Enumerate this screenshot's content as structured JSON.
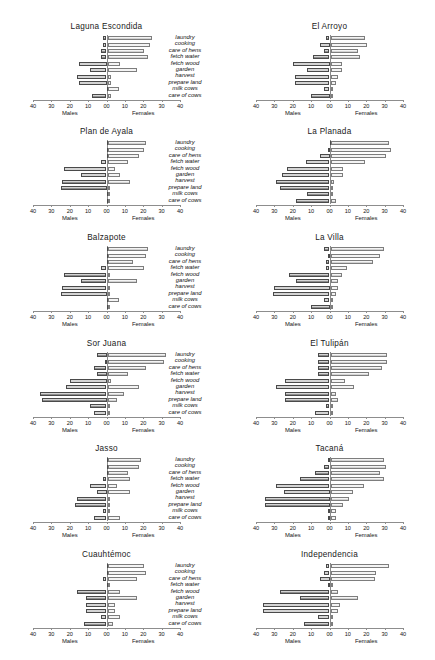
{
  "figure": {
    "width": 435,
    "height": 660,
    "categories": [
      "laundry",
      "cooking",
      "care of hens",
      "fetch water",
      "fetch wood",
      "garden",
      "harvest",
      "prepare land",
      "milk cows",
      "care of cows"
    ],
    "axis": {
      "tick_labels_left": [
        "40",
        "30",
        "20",
        "10",
        "00"
      ],
      "tick_labels_right": [
        "10",
        "20",
        "30",
        "40"
      ],
      "all_tick_labels": [
        "40",
        "30",
        "20",
        "10",
        "00",
        "10",
        "20",
        "30",
        "40"
      ],
      "tick_values": [
        -40,
        -30,
        -20,
        -10,
        0,
        10,
        20,
        30,
        40
      ],
      "xlim": [
        -40,
        40
      ],
      "left_axis_name": "Males",
      "right_axis_name": "Females",
      "grid": false
    },
    "colors": {
      "male_fill": "#8e8e8e",
      "female_fill": "#d3d3d3",
      "male_border": "#4a4a4a",
      "female_border": "#7d7d7d",
      "axis": "#8d8d8d",
      "zero_line": "#8a8a8a",
      "text": "#111111",
      "background": "#ffffff"
    }
  },
  "chart_data": {
    "type": "bar",
    "title": "",
    "subtitle": "",
    "xlabel": "Males | Females",
    "ylabel": "",
    "xlim": [
      -40,
      40
    ],
    "grid": false,
    "legend_position": "none",
    "orientation": "horizontal-diverging",
    "categories": [
      "laundry",
      "cooking",
      "care of hens",
      "fetch water",
      "fetch wood",
      "garden",
      "harvest",
      "prepare land",
      "milk cows",
      "care of cows"
    ],
    "series_names": [
      "Males",
      "Females"
    ],
    "panels": [
      {
        "name": "Laguna Escondida",
        "row": 0,
        "col": 0,
        "series": [
          {
            "name": "Males",
            "values": [
              2,
              2,
              3,
              3,
              15,
              9,
              16,
              15,
              0,
              8
            ]
          },
          {
            "name": "Females",
            "values": [
              24,
              23,
              20,
              22,
              7,
              16,
              2,
              2,
              6,
              2
            ]
          }
        ]
      },
      {
        "name": "El Arroyo",
        "row": 0,
        "col": 1,
        "series": [
          {
            "name": "Males",
            "values": [
              2,
              5,
              3,
              9,
              20,
              12,
              19,
              19,
              3,
              10
            ]
          },
          {
            "name": "Females",
            "values": [
              19,
              20,
              15,
              16,
              6,
              6,
              4,
              3,
              0,
              0
            ]
          }
        ]
      },
      {
        "name": "Plan de Ayala",
        "row": 1,
        "col": 0,
        "series": [
          {
            "name": "Males",
            "values": [
              0,
              0,
              0,
              3,
              23,
              14,
              24,
              25,
              0,
              0
            ]
          },
          {
            "name": "Females",
            "values": [
              21,
              20,
              17,
              11,
              4,
              7,
              12,
              1,
              1,
              0
            ]
          }
        ]
      },
      {
        "name": "La Planada",
        "row": 1,
        "col": 1,
        "series": [
          {
            "name": "Males",
            "values": [
              0,
              1,
              5,
              13,
              23,
              26,
              29,
              27,
              12,
              18
            ]
          },
          {
            "name": "Females",
            "values": [
              32,
              33,
              30,
              19,
              7,
              7,
              2,
              1,
              1,
              3
            ]
          }
        ]
      },
      {
        "name": "Balzapote",
        "row": 2,
        "col": 0,
        "series": [
          {
            "name": "Males",
            "values": [
              0,
              0,
              0,
              3,
              23,
              14,
              24,
              25,
              0,
              0
            ]
          },
          {
            "name": "Females",
            "values": [
              22,
              21,
              14,
              20,
              1,
              16,
              1,
              1,
              6,
              0
            ]
          }
        ]
      },
      {
        "name": "La Villa",
        "row": 2,
        "col": 1,
        "series": [
          {
            "name": "Males",
            "values": [
              3,
              1,
              2,
              2,
              22,
              18,
              30,
              31,
              3,
              10
            ]
          },
          {
            "name": "Females",
            "values": [
              29,
              27,
              23,
              9,
              6,
              4,
              4,
              3,
              1,
              1
            ]
          }
        ]
      },
      {
        "name": "Sor Juana",
        "row": 3,
        "col": 0,
        "series": [
          {
            "name": "Males",
            "values": [
              5,
              1,
              7,
              5,
              20,
              22,
              36,
              35,
              9,
              7
            ]
          },
          {
            "name": "Females",
            "values": [
              32,
              31,
              21,
              11,
              2,
              17,
              9,
              5,
              0,
              0
            ]
          }
        ]
      },
      {
        "name": "El Tulipán",
        "row": 3,
        "col": 1,
        "series": [
          {
            "name": "Males",
            "values": [
              6,
              6,
              6,
              6,
              24,
              29,
              24,
              24,
              2,
              8
            ]
          },
          {
            "name": "Females",
            "values": [
              31,
              31,
              28,
              21,
              8,
              13,
              3,
              4,
              0,
              0
            ]
          }
        ]
      },
      {
        "name": "Jasso",
        "row": 4,
        "col": 0,
        "series": [
          {
            "name": "Males",
            "values": [
              0,
              0,
              0,
              2,
              9,
              5,
              16,
              17,
              2,
              7
            ]
          },
          {
            "name": "Females",
            "values": [
              18,
              17,
              11,
              12,
              5,
              12,
              1,
              1,
              0,
              7
            ]
          }
        ]
      },
      {
        "name": "Tacaná",
        "row": 4,
        "col": 1,
        "series": [
          {
            "name": "Males",
            "values": [
              1,
              3,
              8,
              16,
              29,
              25,
              35,
              35,
              1,
              1
            ]
          },
          {
            "name": "Females",
            "values": [
              29,
              30,
              27,
              29,
              18,
              12,
              10,
              7,
              3,
              3
            ]
          }
        ]
      },
      {
        "name": "Cuauhtémoc",
        "row": 5,
        "col": 0,
        "series": [
          {
            "name": "Males",
            "values": [
              0,
              0,
              2,
              0,
              16,
              11,
              11,
              11,
              3,
              12
            ]
          },
          {
            "name": "Females",
            "values": [
              20,
              21,
              16,
              1,
              7,
              16,
              4,
              4,
              7,
              3
            ]
          }
        ]
      },
      {
        "name": "Independencia",
        "row": 5,
        "col": 1,
        "series": [
          {
            "name": "Males",
            "values": [
              2,
              3,
              5,
              1,
              27,
              16,
              36,
              36,
              6,
              14
            ]
          },
          {
            "name": "Females",
            "values": [
              32,
              25,
              24,
              1,
              4,
              15,
              5,
              4,
              0,
              0
            ]
          }
        ]
      }
    ]
  }
}
